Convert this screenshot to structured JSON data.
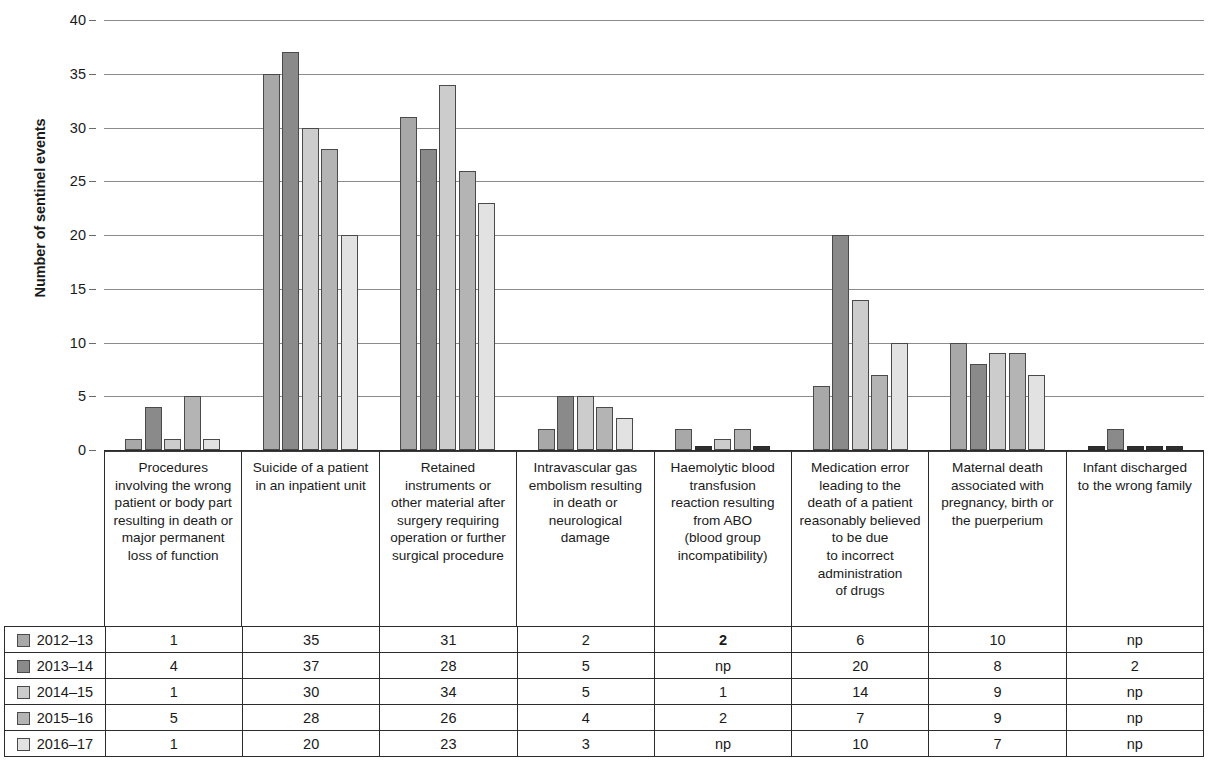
{
  "chart_data": {
    "type": "bar",
    "title": "",
    "xlabel": "",
    "ylabel": "Number of sentinel events",
    "ylim": [
      0,
      40
    ],
    "yticks": [
      0,
      5,
      10,
      15,
      20,
      25,
      30,
      35,
      40
    ],
    "grid": true,
    "legend_position": "table-left",
    "missing_marker": "np",
    "categories": [
      "Procedures\ninvolving the wrong\npatient or body part\nresulting in death or\nmajor permanent\nloss of function",
      "Suicide of a patient\nin an inpatient unit",
      "Retained\ninstruments or\nother material after\nsurgery requiring\noperation or further\nsurgical procedure",
      "Intravascular gas\nembolism resulting\nin death or\nneurological\ndamage",
      "Haemolytic blood\ntransfusion\nreaction resulting\nfrom ABO\n(blood group\nincompatibility)",
      "Medication error\nleading to the\ndeath of a patient\nreasonably believed\nto be due\nto incorrect\nadministration\nof drugs",
      "Maternal death\nassociated with\npregnancy, birth or\nthe puerperium",
      "Infant discharged\nto the wrong family"
    ],
    "series": [
      {
        "name": "2012–13",
        "color": "#a8a8a8",
        "values": [
          1,
          35,
          31,
          2,
          2,
          6,
          10,
          null
        ],
        "display": [
          "1",
          "35",
          "31",
          "2",
          "2",
          "6",
          "10",
          "np"
        ],
        "bold_cells": [
          4
        ]
      },
      {
        "name": "2013–14",
        "color": "#8a8a8a",
        "values": [
          4,
          37,
          28,
          5,
          null,
          20,
          8,
          2
        ],
        "display": [
          "4",
          "37",
          "28",
          "5",
          "np",
          "20",
          "8",
          "2"
        ],
        "bold_cells": []
      },
      {
        "name": "2014–15",
        "color": "#cccccc",
        "values": [
          1,
          30,
          34,
          5,
          1,
          14,
          9,
          null
        ],
        "display": [
          "1",
          "30",
          "34",
          "5",
          "1",
          "14",
          "9",
          "np"
        ],
        "bold_cells": []
      },
      {
        "name": "2015–16",
        "color": "#b4b4b4",
        "values": [
          5,
          28,
          26,
          4,
          2,
          7,
          9,
          null
        ],
        "display": [
          "5",
          "28",
          "26",
          "4",
          "2",
          "7",
          "9",
          "np"
        ],
        "bold_cells": []
      },
      {
        "name": "2016–17",
        "color": "#e2e2e2",
        "values": [
          1,
          20,
          23,
          3,
          null,
          10,
          7,
          null
        ],
        "display": [
          "1",
          "20",
          "23",
          "3",
          "np",
          "10",
          "7",
          "np"
        ],
        "bold_cells": []
      }
    ]
  }
}
